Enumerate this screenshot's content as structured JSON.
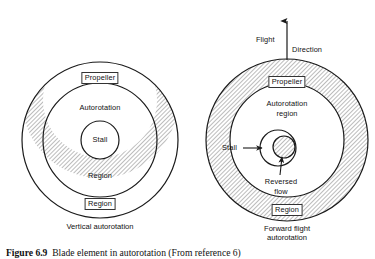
{
  "figure": {
    "caption_label": "Figure 6.9",
    "caption_text": "Blade element in autorotation (From reference 6)"
  },
  "left_diagram": {
    "name": "vertical-autorotation",
    "sub_caption": "Vertical autorotation",
    "labels": {
      "propeller": "Propeller",
      "autorotation": "Autorotation",
      "stall": "Stall",
      "region_inner": "Region",
      "region_outer": "Region"
    }
  },
  "right_diagram": {
    "name": "forward-flight-autorotation",
    "sub_caption_line1": "Forward flight",
    "sub_caption_line2": "autorotation",
    "labels": {
      "flight": "Flight",
      "direction": "Direction",
      "propeller": "Propeller",
      "autorotation_line1": "Autorotation",
      "autorotation_line2": "region",
      "stall": "Stall",
      "reversed_line1": "Reversed",
      "reversed_line2": "flow",
      "region_outer": "Region"
    }
  },
  "style": {
    "line_color": "#1a1a1a",
    "hatch_color": "#808080",
    "background": "#ffffff"
  }
}
